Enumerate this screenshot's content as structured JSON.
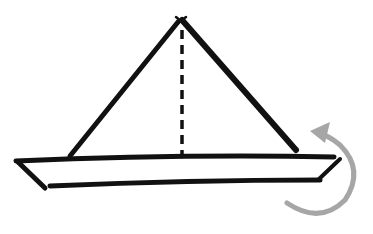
{
  "diagram": {
    "title": "",
    "colors": {
      "background": "#ffffff",
      "ink": "#111111",
      "arrow": "#a6a6a6"
    },
    "elements": [
      {
        "name": "sail-left-edge",
        "type": "solid-line"
      },
      {
        "name": "sail-right-edge",
        "type": "solid-line"
      },
      {
        "name": "center-fold-line",
        "type": "dashed-line"
      },
      {
        "name": "hull-top-edge",
        "type": "solid-line"
      },
      {
        "name": "hull-bottom-edge",
        "type": "solid-line"
      },
      {
        "name": "hull-left-end",
        "type": "solid-line"
      },
      {
        "name": "hull-right-end",
        "type": "solid-line"
      },
      {
        "name": "rotate-arrow",
        "type": "curved-arrow",
        "meaning": "turn over / rotate"
      }
    ]
  }
}
